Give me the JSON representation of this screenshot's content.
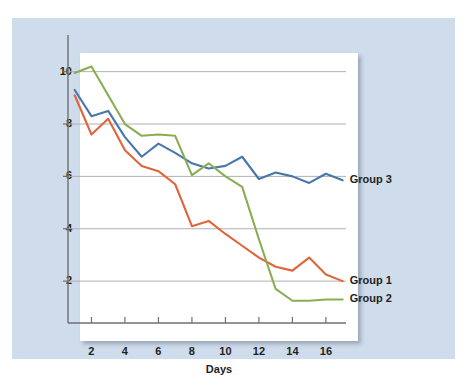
{
  "figure": {
    "background_color": "#cfdceb",
    "plot_background_color": "#ffffff",
    "grid_color": "#b0b0b0",
    "axis_color": "#6e7073"
  },
  "chart_data": {
    "type": "line",
    "title": "",
    "xlabel": "Days",
    "ylabel": "Mean number of errors",
    "xlim": [
      0.6,
      17.2
    ],
    "ylim": [
      0.4,
      11.4
    ],
    "xticks": [
      2,
      4,
      6,
      8,
      10,
      12,
      14,
      16
    ],
    "yticks": [
      2,
      4,
      6,
      8,
      10
    ],
    "grid": "horizontal",
    "legend_position": "inline-right-of-line-ends",
    "x": [
      1,
      2,
      3,
      4,
      5,
      6,
      7,
      8,
      9,
      10,
      11,
      12,
      13,
      14,
      15,
      16,
      17
    ],
    "series": [
      {
        "name": "Group 3",
        "color": "#4a77ab",
        "label": "Group 3",
        "label_x": 17.3,
        "label_y": 5.85,
        "values": [
          9.3,
          8.3,
          8.5,
          7.5,
          6.75,
          7.25,
          6.9,
          6.5,
          6.3,
          6.4,
          6.75,
          5.9,
          6.15,
          6.0,
          5.75,
          6.1,
          5.85
        ]
      },
      {
        "name": "Group 1",
        "color": "#e0643c",
        "label": "Group 1",
        "label_x": 17.3,
        "label_y": 2.0,
        "values": [
          9.1,
          7.6,
          8.2,
          7.0,
          6.4,
          6.2,
          5.7,
          4.1,
          4.3,
          3.8,
          3.35,
          2.9,
          2.55,
          2.4,
          2.9,
          2.25,
          2.0
        ]
      },
      {
        "name": "Group 2",
        "color": "#8aad54",
        "label": "Group 2",
        "label_x": 17.3,
        "label_y": 1.3,
        "values": [
          9.95,
          10.2,
          9.1,
          8.0,
          7.55,
          7.6,
          7.55,
          6.05,
          6.5,
          6.0,
          5.6,
          3.6,
          1.7,
          1.25,
          1.25,
          1.3,
          1.3
        ]
      }
    ]
  },
  "axis": {
    "x_title": "Days",
    "y_title": "Mean number of errors",
    "x_tick_labels": [
      "2",
      "4",
      "6",
      "8",
      "10",
      "12",
      "14",
      "16"
    ],
    "y_tick_labels": [
      "2",
      "4",
      "6",
      "8",
      "10"
    ]
  },
  "legend": {
    "items": [
      {
        "label": "Group 3"
      },
      {
        "label": "Group 1"
      },
      {
        "label": "Group 2"
      }
    ]
  }
}
